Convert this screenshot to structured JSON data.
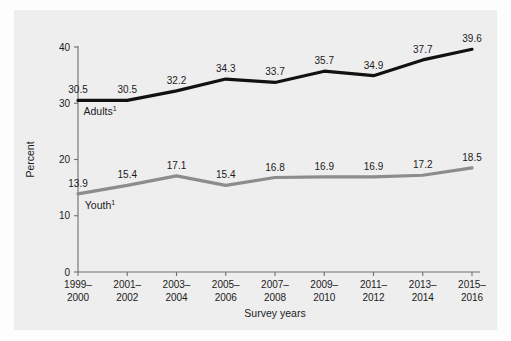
{
  "figure": {
    "background_color": "#eeeeee",
    "page_color": "#fdfdfd"
  },
  "chart_data": {
    "type": "line",
    "title": "",
    "subtitle": "",
    "xlabel": "Survey years",
    "ylabel": "Percent",
    "ylim": [
      0,
      40
    ],
    "yticks": [
      "0",
      "10",
      "20",
      "30",
      "40"
    ],
    "grid": false,
    "legend_position": "inline-on-plot",
    "categories": [
      "1999–\n2000",
      "2001–\n2002",
      "2003–\n2004",
      "2005–\n2006",
      "2007–\n2008",
      "2009–\n2010",
      "2011–\n2012",
      "2013–\n2014",
      "2015–\n2016"
    ],
    "categories_lines": [
      [
        "1999–",
        "2000"
      ],
      [
        "2001–",
        "2002"
      ],
      [
        "2003–",
        "2004"
      ],
      [
        "2005–",
        "2006"
      ],
      [
        "2007–",
        "2008"
      ],
      [
        "2009–",
        "2010"
      ],
      [
        "2011–",
        "2012"
      ],
      [
        "2013–",
        "2014"
      ],
      [
        "2015–",
        "2016"
      ]
    ],
    "series": [
      {
        "name": "Adults",
        "name_superscript": "1",
        "color": "#111111",
        "values": [
          30.5,
          30.5,
          32.2,
          34.3,
          33.7,
          35.7,
          34.9,
          37.7,
          39.6
        ],
        "labels": [
          "30.5",
          "30.5",
          "32.2",
          "34.3",
          "33.7",
          "35.7",
          "34.9",
          "37.7",
          "39.6"
        ]
      },
      {
        "name": "Youth",
        "name_superscript": "1",
        "color": "#8c8c8c",
        "values": [
          13.9,
          15.4,
          17.1,
          15.4,
          16.8,
          16.9,
          16.9,
          17.2,
          18.5
        ],
        "labels": [
          "13.9",
          "15.4",
          "17.1",
          "15.4",
          "16.8",
          "16.9",
          "16.9",
          "17.2",
          "18.5"
        ]
      }
    ]
  }
}
